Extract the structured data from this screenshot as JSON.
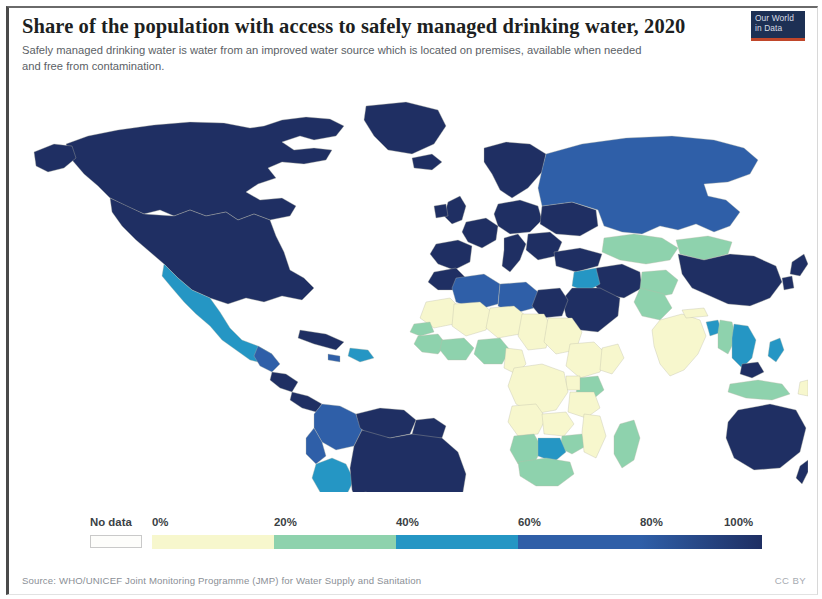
{
  "header": {
    "title": "Share of the population with access to safely managed drinking water, 2020",
    "subtitle": "Safely managed drinking water is water from an improved water source which is located on premises, available when needed and free from contamination."
  },
  "logo": {
    "line1": "Our World",
    "line2": "in Data"
  },
  "footer": {
    "source": "Source: WHO/UNICEF Joint Monitoring Programme (JMP) for Water Supply and Sanitation",
    "license": "CC BY"
  },
  "legend": {
    "no_data_label": "No data",
    "ticks": [
      "0%",
      "20%",
      "40%",
      "60%",
      "80%",
      "100%"
    ],
    "bins": [
      {
        "from": 0,
        "to": 20,
        "color": "#f7f7cd"
      },
      {
        "from": 20,
        "to": 40,
        "color": "#8ed2ad"
      },
      {
        "from": 40,
        "to": 60,
        "color": "#2596c4"
      },
      {
        "from": 60,
        "to": 80,
        "color": "#2f5fa8"
      },
      {
        "from": 80,
        "to": 100,
        "color": "#1f2f63"
      }
    ],
    "no_data_color": "#fdfdfb"
  },
  "chart_data": {
    "type": "heatmap",
    "subtype": "choropleth-world-map",
    "title": "Share of the population with access to safely managed drinking water, 2020",
    "subtitle": "Safely managed drinking water is water from an improved water source which is located on premises, available when needed and free from contamination.",
    "year": 2020,
    "unit": "% of population",
    "value_range": [
      0,
      100
    ],
    "legend_position": "bottom",
    "grid": false,
    "color_scale": {
      "type": "binned-sequential",
      "stops": [
        "#f7f7cd",
        "#8ed2ad",
        "#2596c4",
        "#2f5fa8",
        "#1f2f63"
      ],
      "bin_edges": [
        0,
        20,
        40,
        60,
        80,
        100
      ],
      "no_data": "#fdfdfb"
    },
    "countries": [
      {
        "name": "Canada",
        "value": 99
      },
      {
        "name": "United States",
        "value": 97
      },
      {
        "name": "Greenland",
        "value": 95
      },
      {
        "name": "Mexico",
        "value": 43
      },
      {
        "name": "Guatemala",
        "value": 56
      },
      {
        "name": "Cuba",
        "value": 85
      },
      {
        "name": "Colombia",
        "value": 73
      },
      {
        "name": "Venezuela",
        "value": 85
      },
      {
        "name": "Ecuador",
        "value": 67
      },
      {
        "name": "Peru",
        "value": 51
      },
      {
        "name": "Bolivia",
        "value": 48
      },
      {
        "name": "Brazil",
        "value": 86
      },
      {
        "name": "Chile",
        "value": 99
      },
      {
        "name": "Argentina",
        "value": 89
      },
      {
        "name": "Paraguay",
        "value": 65
      },
      {
        "name": "Uruguay",
        "value": 96
      },
      {
        "name": "United Kingdom",
        "value": 100
      },
      {
        "name": "Ireland",
        "value": 97
      },
      {
        "name": "France",
        "value": 98
      },
      {
        "name": "Spain",
        "value": 98
      },
      {
        "name": "Portugal",
        "value": 96
      },
      {
        "name": "Germany",
        "value": 100
      },
      {
        "name": "Poland",
        "value": 95
      },
      {
        "name": "Italy",
        "value": 95
      },
      {
        "name": "Norway",
        "value": 99
      },
      {
        "name": "Sweden",
        "value": 99
      },
      {
        "name": "Finland",
        "value": 99
      },
      {
        "name": "Iceland",
        "value": 100
      },
      {
        "name": "Ukraine",
        "value": 93
      },
      {
        "name": "Turkey",
        "value": 92
      },
      {
        "name": "Russia",
        "value": 76
      },
      {
        "name": "Kazakhstan",
        "value": 34
      },
      {
        "name": "Uzbekistan",
        "value": 38
      },
      {
        "name": "Mongolia",
        "value": 34
      },
      {
        "name": "Iran",
        "value": 94
      },
      {
        "name": "Iraq",
        "value": 59
      },
      {
        "name": "Saudi Arabia",
        "value": 98
      },
      {
        "name": "Afghanistan",
        "value": 30
      },
      {
        "name": "Pakistan",
        "value": 36
      },
      {
        "name": "India",
        "value": 12
      },
      {
        "name": "Nepal",
        "value": 17
      },
      {
        "name": "Bangladesh",
        "value": 59
      },
      {
        "name": "Myanmar",
        "value": 32
      },
      {
        "name": "Thailand",
        "value": 57
      },
      {
        "name": "Vietnam",
        "value": 57
      },
      {
        "name": "China",
        "value": 88
      },
      {
        "name": "Japan",
        "value": 99
      },
      {
        "name": "South Korea",
        "value": 99
      },
      {
        "name": "Philippines",
        "value": 48
      },
      {
        "name": "Indonesia",
        "value": 30
      },
      {
        "name": "Malaysia",
        "value": 94
      },
      {
        "name": "Australia",
        "value": 100
      },
      {
        "name": "New Zealand",
        "value": 100
      },
      {
        "name": "Papua New Guinea",
        "value": 18
      },
      {
        "name": "Morocco",
        "value": 80
      },
      {
        "name": "Algeria",
        "value": 76
      },
      {
        "name": "Libya",
        "value": 72
      },
      {
        "name": "Egypt",
        "value": 97
      },
      {
        "name": "Mauritania",
        "value": 15
      },
      {
        "name": "Mali",
        "value": 14
      },
      {
        "name": "Niger",
        "value": 13
      },
      {
        "name": "Chad",
        "value": 6
      },
      {
        "name": "Sudan",
        "value": 15
      },
      {
        "name": "Senegal",
        "value": 30
      },
      {
        "name": "Guinea",
        "value": 25
      },
      {
        "name": "Sierra Leone",
        "value": 12
      },
      {
        "name": "Liberia",
        "value": 10
      },
      {
        "name": "Ghana",
        "value": 41
      },
      {
        "name": "Nigeria",
        "value": 22
      },
      {
        "name": "Cameroon",
        "value": 17
      },
      {
        "name": "Ethiopia",
        "value": 13
      },
      {
        "name": "Somalia",
        "value": 9
      },
      {
        "name": "Kenya",
        "value": 32
      },
      {
        "name": "Uganda",
        "value": 18
      },
      {
        "name": "Tanzania",
        "value": 16
      },
      {
        "name": "DR Congo",
        "value": 11
      },
      {
        "name": "Angola",
        "value": 10
      },
      {
        "name": "Zambia",
        "value": 15
      },
      {
        "name": "Zimbabwe",
        "value": 30
      },
      {
        "name": "Mozambique",
        "value": 12
      },
      {
        "name": "Madagascar",
        "value": 21
      },
      {
        "name": "Namibia",
        "value": 34
      },
      {
        "name": "Botswana",
        "value": 40
      },
      {
        "name": "South Africa",
        "value": 34
      }
    ]
  }
}
